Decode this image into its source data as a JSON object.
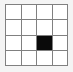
{
  "figure": {
    "name": "grid-diagram",
    "rows": 4,
    "columns": 4,
    "background_color": "#f4f4f4",
    "grid_line_color": "#808080",
    "empty_cell_color": "#ffffff",
    "filled_cell_color": "#0a0a0a",
    "filled_cells": [
      {
        "row": 3,
        "column": 3
      }
    ],
    "cells": [
      [
        {
          "row": 1,
          "column": 1,
          "state": "empty"
        },
        {
          "row": 1,
          "column": 2,
          "state": "empty"
        },
        {
          "row": 1,
          "column": 3,
          "state": "empty"
        },
        {
          "row": 1,
          "column": 4,
          "state": "empty"
        }
      ],
      [
        {
          "row": 2,
          "column": 1,
          "state": "empty"
        },
        {
          "row": 2,
          "column": 2,
          "state": "empty"
        },
        {
          "row": 2,
          "column": 3,
          "state": "empty"
        },
        {
          "row": 2,
          "column": 4,
          "state": "empty"
        }
      ],
      [
        {
          "row": 3,
          "column": 1,
          "state": "empty"
        },
        {
          "row": 3,
          "column": 2,
          "state": "empty"
        },
        {
          "row": 3,
          "column": 3,
          "state": "filled"
        },
        {
          "row": 3,
          "column": 4,
          "state": "empty"
        }
      ],
      [
        {
          "row": 4,
          "column": 1,
          "state": "empty"
        },
        {
          "row": 4,
          "column": 2,
          "state": "empty"
        },
        {
          "row": 4,
          "column": 3,
          "state": "empty"
        },
        {
          "row": 4,
          "column": 4,
          "state": "empty"
        }
      ]
    ]
  }
}
